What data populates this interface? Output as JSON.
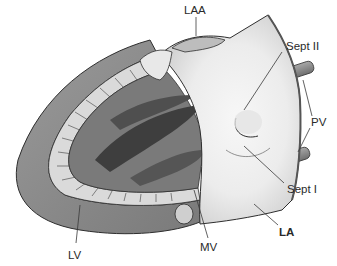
{
  "diagram": {
    "labels": [
      {
        "id": "laa",
        "text": "LAA",
        "bold": false
      },
      {
        "id": "sept2",
        "text": "Sept II",
        "bold": false
      },
      {
        "id": "pv",
        "text": "PV",
        "bold": false
      },
      {
        "id": "sept1",
        "text": "Sept I",
        "bold": false
      },
      {
        "id": "la",
        "text": "LA",
        "bold": true
      },
      {
        "id": "mv",
        "text": "MV",
        "bold": false
      },
      {
        "id": "lv",
        "text": "LV",
        "bold": false
      }
    ],
    "colors": {
      "outer_wall": "#8c8c8c",
      "trabeculae": "#d8d8d8",
      "papillary_dark": "#4a4a4a",
      "atrium_light": "#efefef",
      "vessel": "#8a8a8a",
      "outline": "#2e2e2e"
    }
  }
}
